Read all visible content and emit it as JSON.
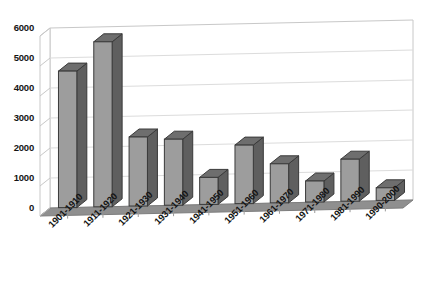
{
  "chart_data": {
    "type": "bar",
    "title": "",
    "subtitle": "",
    "xlabel": "",
    "ylabel": "",
    "categories": [
      "1901-1910",
      "1911-1920",
      "1921-1930",
      "1931-1940",
      "1941-1950",
      "1951-1960",
      "1961-1970",
      "1971-1980",
      "1981-1990",
      "1990-2000"
    ],
    "values": [
      4550,
      5500,
      2300,
      2200,
      900,
      1950,
      1300,
      700,
      1400,
      420
    ],
    "series": [
      {
        "name": "",
        "values": [
          4550,
          5500,
          2300,
          2200,
          900,
          1950,
          1300,
          700,
          1400,
          420
        ]
      }
    ],
    "ylim": [
      0,
      6000
    ],
    "yticks": [
      0,
      1000,
      2000,
      3000,
      4000,
      5000,
      6000
    ],
    "ytick_labels": [
      "0",
      "1000",
      "2000",
      "3000",
      "4000",
      "5000",
      "6000"
    ],
    "grid": true,
    "legend": false,
    "legend_position": "none",
    "style": "3d-column",
    "colors": {
      "bar_front": "#9d9d9d",
      "bar_top": "#6e6e6e",
      "bar_side": "#5f5f5f",
      "bar_outline": "#3a3a3a",
      "floor": "#8f8f8f",
      "wall": "#ffffff",
      "gridline": "#d5d5d5",
      "axis": "#b9b9b9",
      "text": "#141414",
      "background": "#ffffff"
    }
  }
}
